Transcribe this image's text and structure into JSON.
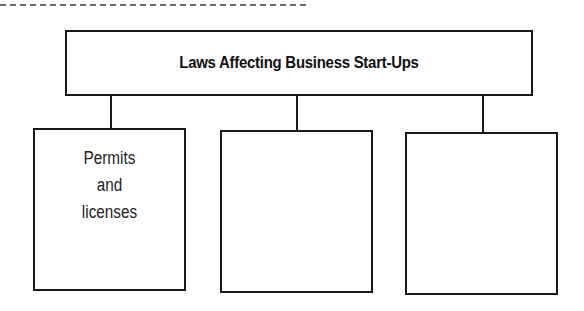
{
  "diagram": {
    "type": "hierarchy",
    "root": {
      "label": "Laws Affecting Business Start-Ups"
    },
    "children": [
      {
        "lines": [
          "Permits",
          "and",
          "licenses"
        ]
      },
      {
        "lines": []
      },
      {
        "lines": []
      }
    ]
  },
  "colors": {
    "stroke": "#1a1a1a",
    "background": "#ffffff",
    "dashed_rule": "#6a6a6a"
  }
}
